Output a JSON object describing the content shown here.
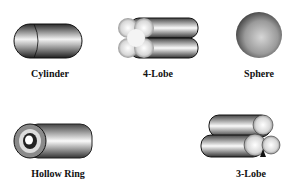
{
  "shapes": [
    {
      "id": "cylinder",
      "label": "Cylinder"
    },
    {
      "id": "four-lobe",
      "label": "4-Lobe"
    },
    {
      "id": "sphere",
      "label": "Sphere"
    },
    {
      "id": "hollow-ring",
      "label": "Hollow Ring"
    },
    {
      "id": "three-lobe",
      "label": "3-Lobe"
    }
  ]
}
